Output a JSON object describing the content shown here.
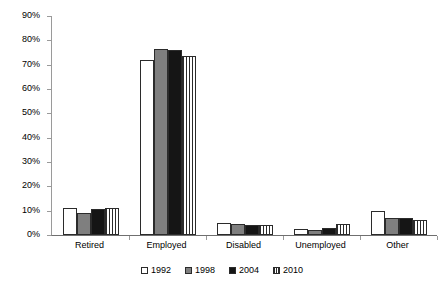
{
  "chart_data": {
    "type": "bar",
    "title": "",
    "xlabel": "",
    "ylabel": "",
    "ylim": [
      0,
      90
    ],
    "ytick_labels": [
      "90%",
      "80%",
      "70%",
      "60%",
      "50%",
      "40%",
      "30%",
      "20%",
      "10%",
      "0%"
    ],
    "ytick_values": [
      90,
      80,
      70,
      60,
      50,
      40,
      30,
      20,
      10,
      0
    ],
    "grid": false,
    "legend_position": "bottom",
    "categories": [
      "Retired",
      "Employed",
      "Disabled",
      "Unemployed",
      "Other"
    ],
    "series": [
      {
        "name": "1992",
        "color": "#ffffff",
        "pattern": "solid",
        "values": [
          11,
          72,
          5,
          2.5,
          10
        ]
      },
      {
        "name": "1998",
        "color": "#7f7f7f",
        "pattern": "solid",
        "values": [
          9,
          76.5,
          4.5,
          2,
          7
        ]
      },
      {
        "name": "2004",
        "color": "#151515",
        "pattern": "solid",
        "values": [
          10.5,
          76,
          4,
          3,
          7
        ]
      },
      {
        "name": "2010",
        "color": "#ffffff",
        "pattern": "vertical-stripes",
        "values": [
          11,
          73.5,
          4,
          4.5,
          6
        ]
      }
    ]
  },
  "legend": {
    "items": [
      {
        "label": "1992"
      },
      {
        "label": "1998"
      },
      {
        "label": "2004"
      },
      {
        "label": "2010"
      }
    ]
  }
}
